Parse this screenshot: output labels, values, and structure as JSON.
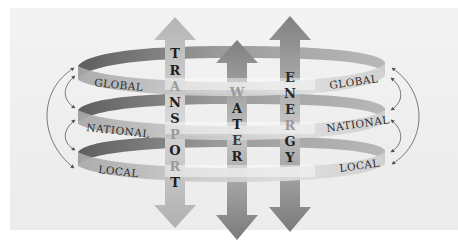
{
  "diagram": {
    "bands": [
      {
        "id": "global",
        "label_left": "GLOBAL",
        "label_right": "GLOBAL"
      },
      {
        "id": "national",
        "label_left": "NATIONAL",
        "label_right": "NATIONAL"
      },
      {
        "id": "local",
        "label_left": "LOCAL",
        "label_right": "LOCAL"
      }
    ],
    "columns": [
      {
        "id": "transport",
        "label": "TRANSPORT",
        "letters": [
          "T",
          "R",
          "A",
          "N",
          "S",
          "P",
          "O",
          "R",
          "T"
        ]
      },
      {
        "id": "water",
        "label": "WATER",
        "letters": [
          "W",
          "A",
          "T",
          "E",
          "R"
        ]
      },
      {
        "id": "energy",
        "label": "ENERGY",
        "letters": [
          "E",
          "N",
          "E",
          "R",
          "G",
          "Y"
        ]
      }
    ],
    "connectors": {
      "left": "bidirectional arrows linking Global, National, Local",
      "right": "bidirectional arrows linking Global, National, Local"
    },
    "colors": {
      "background": "#efefef",
      "band_dark": "#6f6f6f",
      "band_light": "#c9c9c9",
      "arrow_light": "#bdbdbd",
      "arrow_dark": "#8a8a8a",
      "text_dark": "#1e1e1e",
      "text_faded": "#9a9a9a"
    }
  }
}
